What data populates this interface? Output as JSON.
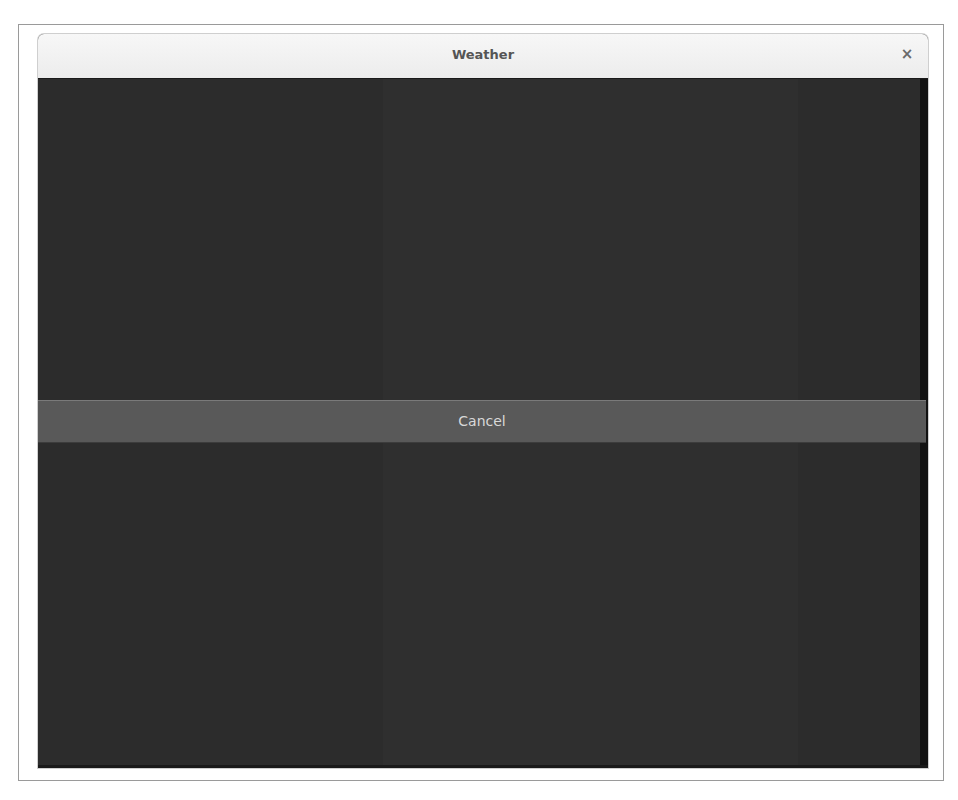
{
  "window": {
    "title": "Weather",
    "close_icon": "×"
  },
  "overlay": {
    "cancel_label": "Cancel"
  },
  "colors": {
    "titlebar": "#efefef",
    "content_background": "#2c2c2c",
    "cancel_bar": "#595959",
    "cancel_text": "#d8d8d8"
  }
}
